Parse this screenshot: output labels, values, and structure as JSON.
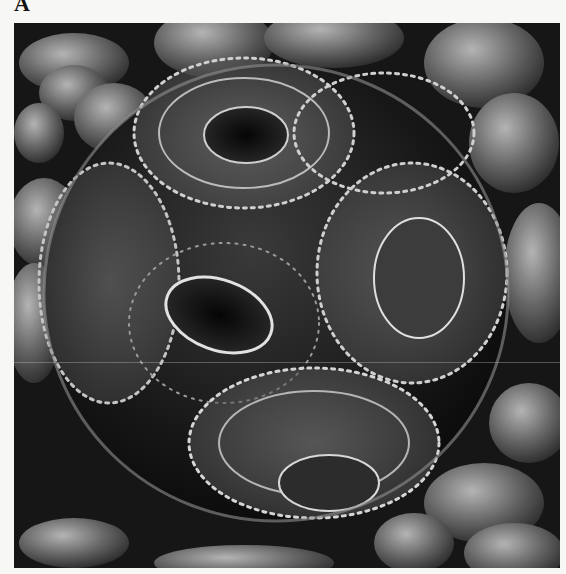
{
  "figure": {
    "panel_label": "A",
    "image": {
      "subject": "coccolithophore coccosphere (SEM micrograph)",
      "icon": "micrograph-image",
      "palette": {
        "background": "#f7f7f5",
        "shadow": "#0a0a0a",
        "mid": "#6e6e6e",
        "highlight": "#e6e6e6"
      }
    }
  }
}
